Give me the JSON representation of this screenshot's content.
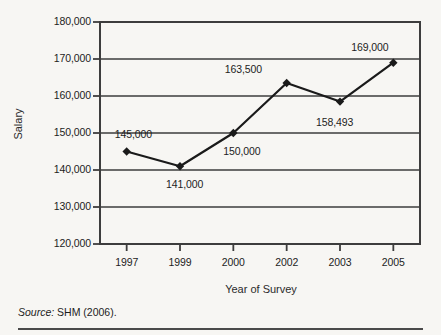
{
  "figure": {
    "title_fragment": "",
    "source_label": "Source:",
    "source_text": "SHM (2006)."
  },
  "chart_data": {
    "type": "line",
    "title": "",
    "xlabel": "Year of Survey",
    "ylabel": "Salary",
    "categories": [
      "1997",
      "1999",
      "2000",
      "2002",
      "2003",
      "2005"
    ],
    "values": [
      145000,
      141000,
      150000,
      163500,
      158493,
      169000
    ],
    "point_labels": [
      "145,000",
      "141,000",
      "150,000",
      "163,500",
      "158,493",
      "169,000"
    ],
    "ylim": [
      120000,
      180000
    ],
    "yticks": [
      120000,
      130000,
      140000,
      150000,
      160000,
      170000,
      180000
    ],
    "ytick_labels": [
      "120,000",
      "130,000",
      "140,000",
      "150,000",
      "160,000",
      "170,000",
      "180,000"
    ],
    "grid": true,
    "legend": "none",
    "line_color": "#1a1a1a",
    "marker": "diamond",
    "grid_color": "#3d3d3d",
    "background": "#f7f6f3"
  }
}
